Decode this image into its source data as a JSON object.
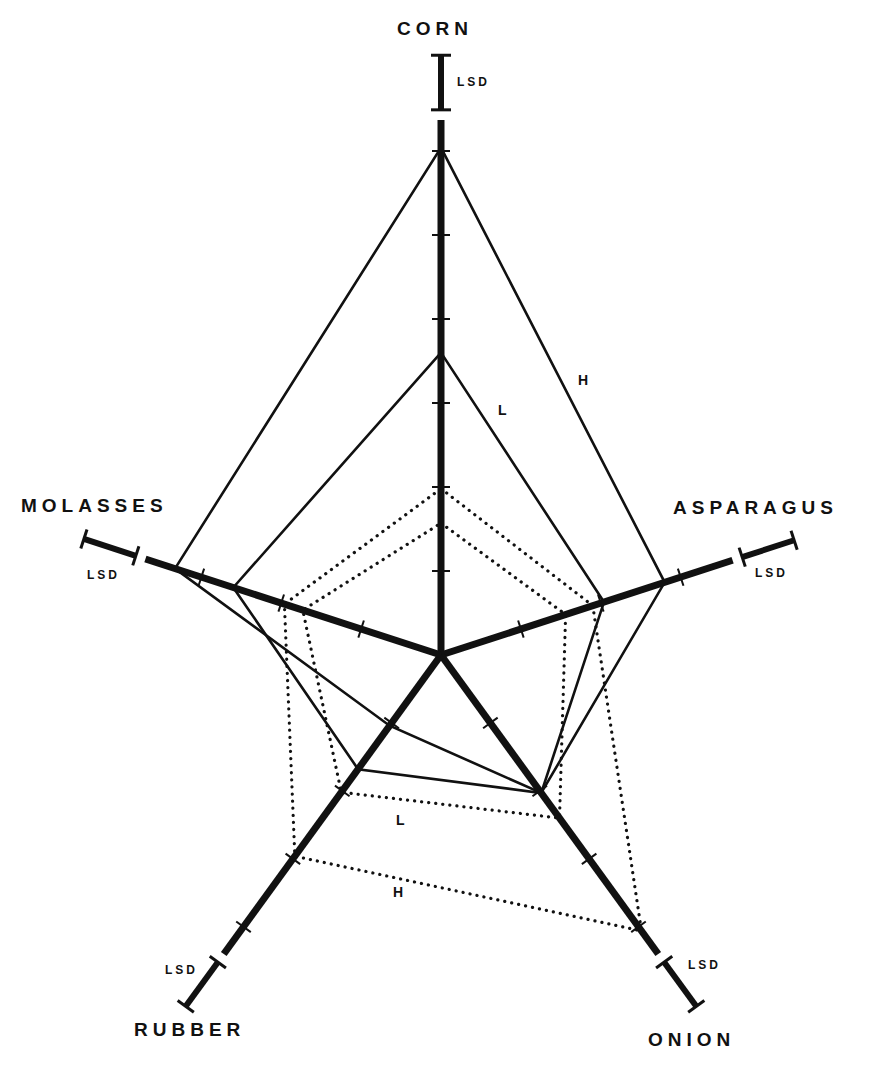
{
  "chart_data": {
    "type": "radar",
    "title": "",
    "axes": [
      "CORN",
      "ASPARAGUS",
      "ONION",
      "RUBBER",
      "MOLASSES"
    ],
    "tick_unit": "arbitrary intensity units (unlabeled ticks)",
    "series": [
      {
        "name": "H",
        "style": "solid",
        "values": [
          6.04,
          2.8,
          2.03,
          1.04,
          3.33
        ]
      },
      {
        "name": "L",
        "style": "solid",
        "values": [
          3.6,
          2.04,
          2.03,
          1.68,
          2.6
        ]
      },
      {
        "name": "H",
        "style": "dotted",
        "values": [
          1.98,
          1.9,
          4.06,
          2.96,
          1.96
        ]
      },
      {
        "name": "L",
        "style": "dotted",
        "values": [
          1.57,
          1.56,
          2.4,
          2.02,
          1.73
        ]
      }
    ],
    "axis_lengths": [
      6.37,
      3.65,
      4.4,
      4.4,
      3.7
    ],
    "ticks": [
      [
        1,
        2,
        3,
        4,
        5,
        6
      ],
      [
        1,
        2,
        3
      ],
      [
        1,
        2,
        3,
        4
      ],
      [
        1,
        2,
        3,
        4
      ],
      [
        1,
        2,
        3
      ]
    ],
    "lsd_bar_length": 0.65,
    "annotations": [
      "LSD",
      "LSD",
      "LSD",
      "LSD",
      "LSD",
      "H",
      "L",
      "L",
      "H"
    ],
    "grid": false,
    "legend": "none (series labelled inline H/L)"
  },
  "labels": {
    "corn": "CORN",
    "asparagus": "ASPARAGUS",
    "onion": "ONION",
    "rubber": "RUBBER",
    "molasses": "MOLASSES",
    "lsd": "LSD",
    "solid_h": "H",
    "solid_l": "L",
    "dotted_l": "L",
    "dotted_h": "H"
  },
  "geometry": {
    "center": [
      441,
      655
    ],
    "unit_px": 84,
    "angles_deg": [
      90,
      18,
      -54,
      -126,
      162
    ]
  }
}
